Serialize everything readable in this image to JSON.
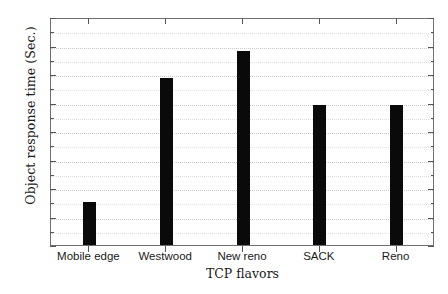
{
  "chart_data": {
    "type": "bar",
    "title": "",
    "xlabel": "TCP flavors",
    "ylabel": "Object response time (Sec.)",
    "categories": [
      "Mobile edge",
      "Westwood",
      "New reno",
      "SACK",
      "Reno"
    ],
    "values": [
      1.5,
      5.85,
      6.8,
      4.9,
      4.9
    ],
    "ylim": [
      0,
      8
    ],
    "ytick_labels": [
      "0",
      "1",
      "2",
      "3",
      "4",
      "5",
      "6",
      "7",
      "8"
    ],
    "ytick_values": [
      0,
      1,
      2,
      3,
      4,
      5,
      6,
      7,
      8
    ],
    "yminor_values": [
      0.5,
      1.5,
      2.5,
      3.5,
      4.5,
      5.5,
      6.5,
      7.5
    ],
    "grid": true,
    "legend": null,
    "bar_color": "#0a0a0a",
    "grid_color": "#c9c9c9",
    "axis_color": "#6f6f6f"
  }
}
